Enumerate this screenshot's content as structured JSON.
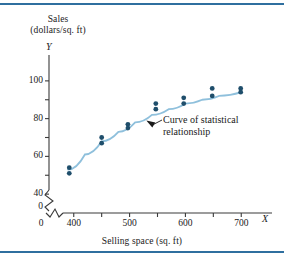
{
  "chart_data": {
    "type": "scatter",
    "title": "",
    "subtitle": "",
    "ylabel_line1": "Sales",
    "ylabel_line2": "(dollars/sq. ft)",
    "xlabel": "Selling space (sq. ft)",
    "x_axis_variable": "X",
    "y_axis_variable": "Y",
    "xlim": [
      370,
      730
    ],
    "ylim": [
      30,
      110
    ],
    "x_ticks": [
      400,
      450,
      500,
      550,
      600,
      650,
      700
    ],
    "x_tick_labels": [
      "400",
      "",
      "500",
      "",
      "600",
      "",
      "700"
    ],
    "x_origin_label": "0",
    "y_ticks": [
      40,
      50,
      60,
      70,
      80,
      90,
      100
    ],
    "y_tick_labels": [
      "40",
      "",
      "60",
      "",
      "80",
      "",
      "100"
    ],
    "y_origin_label": "0",
    "axis_break": true,
    "grid": false,
    "legend": "none",
    "annotations": [
      {
        "text_line1": "Curve of statistical",
        "text_line2": "relationship",
        "points_to_x": 530,
        "points_to_y": 79
      }
    ],
    "series": [
      {
        "name": "Observations",
        "type": "scatter",
        "marker": "circle",
        "color": "#1f4e6b",
        "points": [
          {
            "x": 392,
            "y": 54
          },
          {
            "x": 392,
            "y": 51
          },
          {
            "x": 450,
            "y": 70
          },
          {
            "x": 450,
            "y": 67
          },
          {
            "x": 497,
            "y": 77
          },
          {
            "x": 497,
            "y": 75
          },
          {
            "x": 547,
            "y": 88
          },
          {
            "x": 547,
            "y": 85
          },
          {
            "x": 597,
            "y": 91
          },
          {
            "x": 597,
            "y": 88
          },
          {
            "x": 648,
            "y": 96
          },
          {
            "x": 648,
            "y": 92
          },
          {
            "x": 699,
            "y": 96
          },
          {
            "x": 699,
            "y": 94
          }
        ]
      },
      {
        "name": "Curve of statistical relationship",
        "type": "line",
        "color": "#8fc0dc",
        "points": [
          {
            "x": 390,
            "y": 53
          },
          {
            "x": 420,
            "y": 61
          },
          {
            "x": 450,
            "y": 68
          },
          {
            "x": 480,
            "y": 73
          },
          {
            "x": 510,
            "y": 78
          },
          {
            "x": 540,
            "y": 82
          },
          {
            "x": 570,
            "y": 85
          },
          {
            "x": 600,
            "y": 88
          },
          {
            "x": 630,
            "y": 90
          },
          {
            "x": 660,
            "y": 92
          },
          {
            "x": 700,
            "y": 94
          }
        ]
      }
    ]
  },
  "style": {
    "rule_color": "#2f6f9f",
    "axis_color": "#3a3a3a",
    "point_color": "#1f4e6b",
    "curve_color": "#8fc0dc",
    "background": "#ffffff"
  }
}
